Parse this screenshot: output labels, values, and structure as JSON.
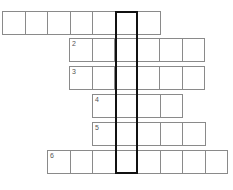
{
  "puzzle": {
    "type": "crossword",
    "cell_size": 22.5,
    "rows": [
      {
        "number": "",
        "y": 11,
        "start_x": 2,
        "cells": 7
      },
      {
        "number": "2",
        "y": 38,
        "start_x": 69,
        "cells": 6
      },
      {
        "number": "3",
        "y": 66,
        "start_x": 69,
        "cells": 6
      },
      {
        "number": "4",
        "y": 94,
        "start_x": 92,
        "cells": 4
      },
      {
        "number": "5",
        "y": 122,
        "start_x": 92,
        "cells": 5
      },
      {
        "number": "6",
        "y": 150,
        "start_x": 47,
        "cells": 8
      }
    ],
    "highlight_column": {
      "x": 115,
      "y": 11,
      "width": 23,
      "height": 163
    },
    "colors": {
      "grid": "#8a8a8a",
      "highlight": "#111111",
      "background": "#ffffff"
    }
  }
}
